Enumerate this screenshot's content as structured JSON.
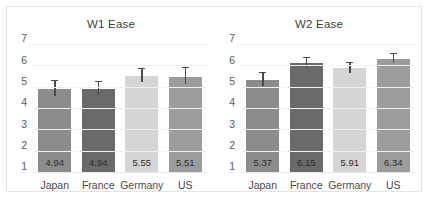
{
  "figure": {
    "background": "#ffffff",
    "border_color": "#e3e3e3"
  },
  "chart_data": [
    {
      "type": "bar",
      "title": "W1 Ease",
      "xlabel": "",
      "ylabel": "",
      "categories": [
        "Japan",
        "France",
        "Germany",
        "US"
      ],
      "values": [
        4.94,
        4.94,
        5.55,
        5.51
      ],
      "value_labels": [
        "4.94",
        "4.94",
        "5.55",
        "5.51"
      ],
      "errors_upper": [
        0.36,
        0.34,
        0.33,
        0.42
      ],
      "errors_lower": [
        0.33,
        0.3,
        0.28,
        0.36
      ],
      "bar_colors": [
        "#8c8c8c",
        "#6a6a6a",
        "#d5d5d5",
        "#9c9c9c"
      ],
      "ylim": [
        1,
        7
      ],
      "yticks": [
        7,
        6,
        5,
        4,
        3,
        2,
        1
      ],
      "ytick_labels": [
        "7",
        "6",
        "5",
        "4",
        "3",
        "2",
        "1"
      ],
      "grid": true,
      "legend": "none"
    },
    {
      "type": "bar",
      "title": "W2 Ease",
      "xlabel": "",
      "ylabel": "",
      "categories": [
        "Japan",
        "France",
        "Germany",
        "US"
      ],
      "values": [
        5.37,
        6.15,
        5.91,
        6.34
      ],
      "value_labels": [
        "5.37",
        "6.15",
        "5.91",
        "6.34"
      ],
      "errors_upper": [
        0.33,
        0.23,
        0.26,
        0.22
      ],
      "errors_lower": [
        0.3,
        0.21,
        0.24,
        0.2
      ],
      "bar_colors": [
        "#8c8c8c",
        "#6a6a6a",
        "#d5d5d5",
        "#9c9c9c"
      ],
      "ylim": [
        1,
        7
      ],
      "yticks": [
        7,
        6,
        5,
        4,
        3,
        2,
        1
      ],
      "ytick_labels": [
        "7",
        "6",
        "5",
        "4",
        "3",
        "2",
        "1"
      ],
      "grid": true,
      "legend": "none"
    }
  ]
}
